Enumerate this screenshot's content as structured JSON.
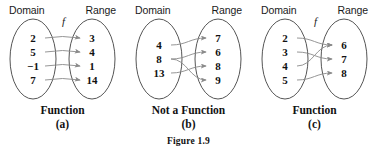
{
  "figure": {
    "caption": "Figure 1.9"
  },
  "labels": {
    "domain": "Domain",
    "range": "Range",
    "function_symbol": "f"
  },
  "panels": [
    {
      "id": "a",
      "letter": "(a)",
      "verdict": "Function",
      "has_function_label": true,
      "domain": [
        "2",
        "5",
        "−1",
        "7"
      ],
      "range": [
        "3",
        "4",
        "1",
        "14"
      ],
      "mappings": [
        {
          "from": 0,
          "to": 0
        },
        {
          "from": 1,
          "to": 1
        },
        {
          "from": 2,
          "to": 2
        },
        {
          "from": 3,
          "to": 3
        }
      ]
    },
    {
      "id": "b",
      "letter": "(b)",
      "verdict": "Not a Function",
      "has_function_label": false,
      "domain": [
        "4",
        "8",
        "13"
      ],
      "range": [
        "7",
        "6",
        "8",
        "9"
      ],
      "mappings": [
        {
          "from": 0,
          "to": 0
        },
        {
          "from": 1,
          "to": 1
        },
        {
          "from": 1,
          "to": 3
        },
        {
          "from": 2,
          "to": 2
        }
      ]
    },
    {
      "id": "c",
      "letter": "(c)",
      "verdict": "Function",
      "has_function_label": true,
      "domain": [
        "2",
        "3",
        "4",
        "5"
      ],
      "range": [
        "6",
        "7",
        "8"
      ],
      "mappings": [
        {
          "from": 0,
          "to": 0
        },
        {
          "from": 1,
          "to": 1
        },
        {
          "from": 2,
          "to": 0
        },
        {
          "from": 3,
          "to": 2
        }
      ]
    }
  ],
  "colors": {
    "text": "#111111",
    "oval_stroke": "#555555",
    "arrow_stroke": "#8a8a8a",
    "background": "#ffffff"
  }
}
